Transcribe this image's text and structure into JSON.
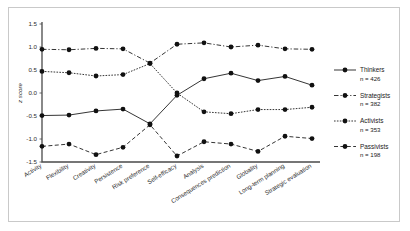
{
  "chart_data": {
    "type": "line",
    "title": "",
    "xlabel": "",
    "ylabel": "z score",
    "ylim": [
      -1.5,
      1.5
    ],
    "ytick_labels": [
      "1.5",
      "1.0",
      "0.5",
      "0.0",
      "-0.5",
      "-1.0",
      "-1.5"
    ],
    "ytick_values": [
      1.5,
      1.0,
      0.5,
      0.0,
      -0.5,
      -1.0,
      -1.5
    ],
    "grid": false,
    "legend_position": "right",
    "categories": [
      "Activity",
      "Flexibility",
      "Creativity",
      "Persistence",
      "Risk preference",
      "Self-efficacy",
      "Analysis",
      "Consequences prediction",
      "Globality",
      "Long-term planning",
      "Strategic evaluation"
    ],
    "series": [
      {
        "name": "Thinkers",
        "n_label": "n = 426",
        "n": 426,
        "line_style": "solid",
        "values": [
          -0.49,
          -0.48,
          -0.39,
          -0.35,
          -0.67,
          -0.05,
          0.31,
          0.43,
          0.27,
          0.36,
          0.17
        ]
      },
      {
        "name": "Strategists",
        "n_label": "n = 382",
        "n": 382,
        "line_style": "dash-dot",
        "values": [
          0.95,
          0.94,
          0.97,
          0.96,
          0.65,
          1.06,
          1.09,
          1.0,
          1.04,
          0.96,
          0.95
        ]
      },
      {
        "name": "Activists",
        "n_label": "n = 353",
        "n": 353,
        "line_style": "dotted",
        "values": [
          0.47,
          0.44,
          0.37,
          0.4,
          0.64,
          0.0,
          -0.41,
          -0.45,
          -0.36,
          -0.36,
          -0.31
        ]
      },
      {
        "name": "Passivists",
        "n_label": "n = 198",
        "n": 198,
        "line_style": "dashed",
        "values": [
          -1.16,
          -1.11,
          -1.34,
          -1.18,
          -0.69,
          -1.37,
          -1.06,
          -1.11,
          -1.27,
          -0.94,
          -0.99
        ]
      }
    ]
  },
  "legend": {
    "entries": [
      {
        "label": "Thinkers",
        "n_label": "n = 426"
      },
      {
        "label": "Strategists",
        "n_label": "n = 382"
      },
      {
        "label": "Activists",
        "n_label": "n = 353"
      },
      {
        "label": "Passivists",
        "n_label": "n = 198"
      }
    ]
  },
  "colors": {
    "line": "#111111",
    "axis": "#4a4a4a",
    "text": "#1a1a1a",
    "frame": "#c9c9c9",
    "background": "#ffffff"
  }
}
